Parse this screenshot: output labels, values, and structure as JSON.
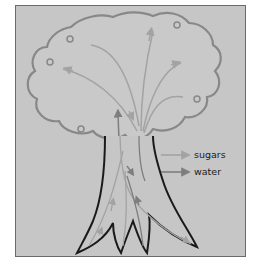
{
  "diagram": {
    "legend": [
      {
        "label": "sugars",
        "color": "#a3a3a3"
      },
      {
        "label": "water",
        "color": "#7e7e7e"
      }
    ],
    "colors": {
      "background": "#c6c6c6",
      "frame_border": "#6a6a6a",
      "canopy_outline": "#888888",
      "trunk_outline": "#1a1a1a"
    }
  }
}
